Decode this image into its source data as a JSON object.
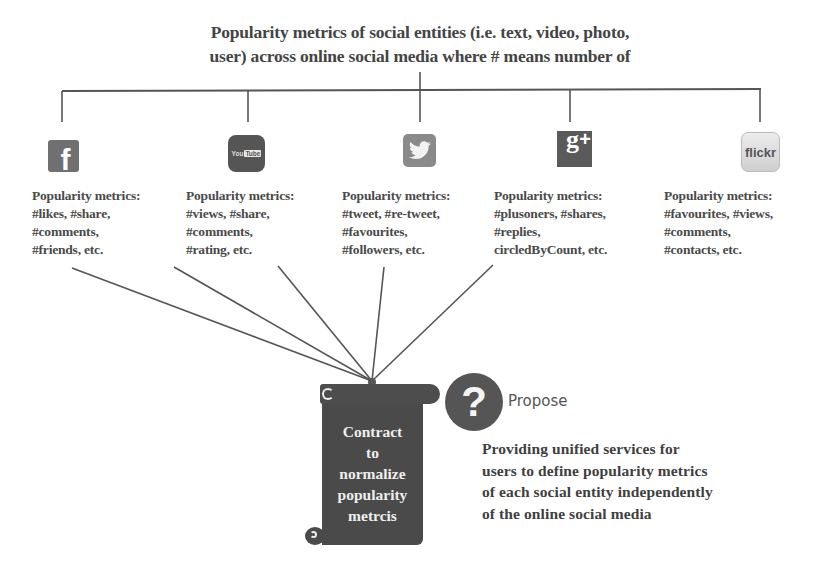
{
  "title": {
    "line1": "Popularity metrics of social entities (i.e. text,  video, photo,",
    "line2": "user) across online social media  where # means number of"
  },
  "platforms": [
    {
      "name": "Facebook",
      "icon": "facebook-icon",
      "icon_glyph": "f",
      "metrics_label": "Popularity metrics:",
      "metrics_lines": [
        "#likes,  #share,",
        "#comments,",
        "#friends, etc."
      ]
    },
    {
      "name": "YouTube",
      "icon": "youtube-icon",
      "icon_glyph_you": "You",
      "icon_glyph_tube": "Tube",
      "metrics_label": "Popularity metrics:",
      "metrics_lines": [
        "#views, #share,",
        "#comments,",
        "#rating, etc."
      ]
    },
    {
      "name": "Twitter",
      "icon": "twitter-icon",
      "metrics_label": "Popularity metrics:",
      "metrics_lines": [
        "#tweet, #re-tweet,",
        "#favourites,",
        "#followers, etc."
      ]
    },
    {
      "name": "Google+",
      "icon": "google-plus-icon",
      "icon_glyph_g": "g",
      "icon_glyph_plus": "+",
      "metrics_label": "Popularity metrics:",
      "metrics_lines": [
        "#plusoners, #shares,",
        "#replies,",
        "circledByCount, etc."
      ]
    },
    {
      "name": "Flickr",
      "icon": "flickr-icon",
      "icon_glyph": "flickr",
      "metrics_label": "Popularity metrics:",
      "metrics_lines": [
        "#favourites, #views,",
        "#comments,",
        "#contacts, etc."
      ]
    }
  ],
  "contract": {
    "lines": [
      "Contract",
      "to",
      "normalize",
      "popularity",
      "metrcis"
    ]
  },
  "propose": {
    "icon": "question-mark-icon",
    "glyph": "?",
    "label": "Propose"
  },
  "description": {
    "lines": [
      "Providing unified services for",
      "users to define popularity metrics",
      "of each social entity independently",
      "of the online social media"
    ]
  },
  "colors": {
    "line": "#555555",
    "text": "#444444",
    "scroll": "#4a4a4a",
    "icon_dark": "#555555"
  }
}
